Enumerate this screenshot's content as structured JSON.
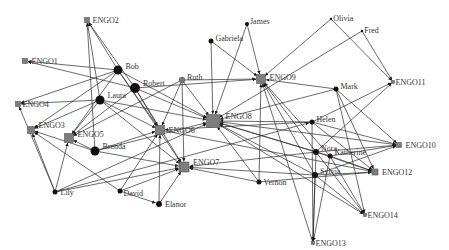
{
  "diagram": {
    "type": "directed-network",
    "colors": {
      "edge": "#2a2a2a",
      "person": "#111111",
      "person_highlight": "#777777",
      "engo": "#7d7d7d",
      "label": "#333333"
    },
    "nodes": [
      {
        "id": "ENGO1",
        "label": "ENGO1",
        "kind": "engo",
        "x": 25,
        "y": 61,
        "size": 5,
        "lx": 6,
        "ly": 3
      },
      {
        "id": "ENGO2",
        "label": "ENGO2",
        "kind": "engo",
        "x": 87,
        "y": 20,
        "size": 5,
        "lx": 5,
        "ly": 3
      },
      {
        "id": "ENGO3",
        "label": "ENGO3",
        "kind": "engo",
        "x": 31,
        "y": 130,
        "size": 7,
        "lx": 6,
        "ly": -2
      },
      {
        "id": "ENGO4",
        "label": "ENGO4",
        "kind": "engo",
        "x": 18,
        "y": 104,
        "size": 5,
        "lx": 4,
        "ly": 3
      },
      {
        "id": "ENGO5",
        "label": "ENGO5",
        "kind": "engo",
        "x": 69,
        "y": 138,
        "size": 9,
        "lx": 6,
        "ly": -1
      },
      {
        "id": "ENGO6",
        "label": "ENGO6",
        "kind": "engo",
        "x": 160,
        "y": 130,
        "size": 9,
        "lx": 6,
        "ly": 3
      },
      {
        "id": "ENGO7",
        "label": "ENGO7",
        "kind": "engo",
        "x": 184,
        "y": 167,
        "size": 10,
        "lx": 6,
        "ly": -2
      },
      {
        "id": "ENGO8",
        "label": "ENGO8",
        "kind": "engo",
        "x": 213,
        "y": 121,
        "size": 13,
        "lx": 8,
        "ly": -2
      },
      {
        "id": "ENGO9",
        "label": "ENGO9",
        "kind": "engo",
        "x": 261,
        "y": 79,
        "size": 9,
        "lx": 6,
        "ly": 1
      },
      {
        "id": "ENGO10",
        "label": "ENGO10",
        "kind": "engo",
        "x": 399,
        "y": 145,
        "size": 5,
        "lx": 6,
        "ly": 3
      },
      {
        "id": "ENGO11",
        "label": "ENGO11",
        "kind": "engo",
        "x": 393,
        "y": 82,
        "size": 3,
        "lx": 3,
        "ly": 3
      },
      {
        "id": "ENGO12",
        "label": "ENGO12",
        "kind": "engo",
        "x": 375,
        "y": 172,
        "size": 6,
        "lx": 6,
        "ly": 3
      },
      {
        "id": "ENGO13",
        "label": "ENGO13",
        "kind": "engo",
        "x": 313,
        "y": 243,
        "size": 3,
        "lx": 3,
        "ly": 3
      },
      {
        "id": "ENGO14",
        "label": "ENGO14",
        "kind": "engo",
        "x": 365,
        "y": 215,
        "size": 3,
        "lx": 3,
        "ly": 3
      },
      {
        "id": "Bob",
        "label": "Bob",
        "kind": "person",
        "x": 118,
        "y": 70,
        "size": 4.5,
        "lx": 5,
        "ly": -1
      },
      {
        "id": "Robert",
        "label": "Robert",
        "kind": "person",
        "x": 135,
        "y": 88,
        "size": 5,
        "lx": 5,
        "ly": -2
      },
      {
        "id": "Laura",
        "label": "Laura",
        "kind": "person",
        "x": 100,
        "y": 100,
        "size": 4.5,
        "lx": 5,
        "ly": -2
      },
      {
        "id": "Brenda",
        "label": "Brenda",
        "kind": "person",
        "x": 95,
        "y": 151,
        "size": 4.5,
        "lx": 5,
        "ly": -2
      },
      {
        "id": "Ruth",
        "label": "Ruth",
        "kind": "person-highlight",
        "x": 182,
        "y": 80,
        "size": 3,
        "lx": 4,
        "ly": 0
      },
      {
        "id": "Gabriela",
        "label": "Gabriela",
        "kind": "person",
        "x": 211,
        "y": 41,
        "size": 2.5,
        "lx": 4,
        "ly": 0
      },
      {
        "id": "James",
        "label": "James",
        "kind": "person",
        "x": 247,
        "y": 24,
        "size": 2,
        "lx": 3,
        "ly": 0
      },
      {
        "id": "Olivia",
        "label": "Olivia",
        "kind": "person",
        "x": 331,
        "y": 19,
        "size": 1.2,
        "lx": 3,
        "ly": 2
      },
      {
        "id": "Fred",
        "label": "Fred",
        "kind": "person",
        "x": 362,
        "y": 31,
        "size": 1.2,
        "lx": 3,
        "ly": 2
      },
      {
        "id": "Mark",
        "label": "Mark",
        "kind": "person",
        "x": 336,
        "y": 89,
        "size": 2.5,
        "lx": 4,
        "ly": 0
      },
      {
        "id": "Helen",
        "label": "Helen",
        "kind": "person",
        "x": 312,
        "y": 122,
        "size": 2.5,
        "lx": 4,
        "ly": 0
      },
      {
        "id": "Nora",
        "label": "Nora",
        "kind": "person",
        "x": 316,
        "y": 152,
        "size": 3,
        "lx": 4,
        "ly": -1
      },
      {
        "id": "Katherine",
        "label": "Katherine",
        "kind": "person",
        "x": 330,
        "y": 156,
        "size": 2.5,
        "lx": 4,
        "ly": -1
      },
      {
        "id": "Sylvia",
        "label": "Sylvia",
        "kind": "person",
        "x": 315,
        "y": 175,
        "size": 3,
        "lx": 4,
        "ly": -1
      },
      {
        "id": "Vernon",
        "label": "Vernon",
        "kind": "person",
        "x": 259,
        "y": 182,
        "size": 2.5,
        "lx": 4,
        "ly": 3
      },
      {
        "id": "Lily",
        "label": "Lily",
        "kind": "person",
        "x": 55,
        "y": 192,
        "size": 2.5,
        "lx": 5,
        "ly": 3
      },
      {
        "id": "David",
        "label": "David",
        "kind": "person",
        "x": 120,
        "y": 191,
        "size": 2.5,
        "lx": 3,
        "ly": 5
      },
      {
        "id": "Elanor",
        "label": "Elanor",
        "kind": "person",
        "x": 159,
        "y": 204,
        "size": 3,
        "lx": 5,
        "ly": 3
      }
    ],
    "edges": [
      [
        "Bob",
        "ENGO2"
      ],
      [
        "Robert",
        "ENGO2"
      ],
      [
        "Laura",
        "ENGO2"
      ],
      [
        "Brenda",
        "ENGO2"
      ],
      [
        "Bob",
        "ENGO1"
      ],
      [
        "Robert",
        "ENGO1"
      ],
      [
        "Bob",
        "ENGO4"
      ],
      [
        "Laura",
        "ENGO4"
      ],
      [
        "Lily",
        "ENGO4"
      ],
      [
        "Bob",
        "ENGO3"
      ],
      [
        "Laura",
        "ENGO3"
      ],
      [
        "Lily",
        "ENGO3"
      ],
      [
        "David",
        "ENGO3"
      ],
      [
        "Brenda",
        "ENGO3"
      ],
      [
        "Bob",
        "ENGO5"
      ],
      [
        "Laura",
        "ENGO5"
      ],
      [
        "Robert",
        "ENGO5"
      ],
      [
        "Brenda",
        "ENGO5"
      ],
      [
        "Lily",
        "ENGO5"
      ],
      [
        "Ruth",
        "ENGO5"
      ],
      [
        "Bob",
        "ENGO6"
      ],
      [
        "Robert",
        "ENGO6"
      ],
      [
        "Laura",
        "ENGO6"
      ],
      [
        "Brenda",
        "ENGO6"
      ],
      [
        "Ruth",
        "ENGO6"
      ],
      [
        "Elanor",
        "ENGO6"
      ],
      [
        "Helen",
        "ENGO6"
      ],
      [
        "David",
        "ENGO6"
      ],
      [
        "Bob",
        "ENGO7"
      ],
      [
        "Robert",
        "ENGO7"
      ],
      [
        "Laura",
        "ENGO7"
      ],
      [
        "Brenda",
        "ENGO7"
      ],
      [
        "Ruth",
        "ENGO7"
      ],
      [
        "Elanor",
        "ENGO7"
      ],
      [
        "Vernon",
        "ENGO7"
      ],
      [
        "Sylvia",
        "ENGO7"
      ],
      [
        "Nora",
        "ENGO7"
      ],
      [
        "David",
        "ENGO7"
      ],
      [
        "Lily",
        "ENGO7"
      ],
      [
        "Bob",
        "ENGO8"
      ],
      [
        "Robert",
        "ENGO8"
      ],
      [
        "Laura",
        "ENGO8"
      ],
      [
        "Ruth",
        "ENGO8"
      ],
      [
        "Gabriela",
        "ENGO8"
      ],
      [
        "James",
        "ENGO8"
      ],
      [
        "Brenda",
        "ENGO8"
      ],
      [
        "Helen",
        "ENGO8"
      ],
      [
        "Nora",
        "ENGO8"
      ],
      [
        "Vernon",
        "ENGO8"
      ],
      [
        "Sylvia",
        "ENGO8"
      ],
      [
        "Katherine",
        "ENGO8"
      ],
      [
        "Mark",
        "ENGO8"
      ],
      [
        "Lily",
        "ENGO8"
      ],
      [
        "Fred",
        "ENGO8"
      ],
      [
        "Gabriela",
        "ENGO9"
      ],
      [
        "James",
        "ENGO9"
      ],
      [
        "Ruth",
        "ENGO9"
      ],
      [
        "Robert",
        "ENGO9"
      ],
      [
        "Olivia",
        "ENGO9"
      ],
      [
        "Mark",
        "ENGO9"
      ],
      [
        "Nora",
        "ENGO9"
      ],
      [
        "Sylvia",
        "ENGO9"
      ],
      [
        "Vernon",
        "ENGO9"
      ],
      [
        "Katherine",
        "ENGO9"
      ],
      [
        "ENGO13",
        "ENGO9"
      ],
      [
        "Olivia",
        "ENGO11"
      ],
      [
        "Fred",
        "ENGO11"
      ],
      [
        "Helen",
        "ENGO11"
      ],
      [
        "Nora",
        "ENGO11"
      ],
      [
        "Helen",
        "ENGO10"
      ],
      [
        "Mark",
        "ENGO10"
      ],
      [
        "Nora",
        "ENGO10"
      ],
      [
        "Katherine",
        "ENGO10"
      ],
      [
        "Sylvia",
        "ENGO10"
      ],
      [
        "ENGO8",
        "ENGO10"
      ],
      [
        "Nora",
        "ENGO12"
      ],
      [
        "Katherine",
        "ENGO12"
      ],
      [
        "Sylvia",
        "ENGO12"
      ],
      [
        "Mark",
        "ENGO12"
      ],
      [
        "Helen",
        "ENGO12"
      ],
      [
        "Vernon",
        "ENGO12"
      ],
      [
        "ENGO6",
        "ENGO12"
      ],
      [
        "Katherine",
        "ENGO14"
      ],
      [
        "Mark",
        "ENGO14"
      ],
      [
        "Sylvia",
        "ENGO14"
      ],
      [
        "Nora",
        "ENGO14"
      ],
      [
        "ENGO8",
        "ENGO14"
      ],
      [
        "Sylvia",
        "ENGO13"
      ],
      [
        "Nora",
        "ENGO13"
      ],
      [
        "Katherine",
        "ENGO13"
      ],
      [
        "Helen",
        "ENGO13"
      ],
      [
        "Lily",
        "Helen"
      ],
      [
        "David",
        "Elanor"
      ]
    ]
  }
}
